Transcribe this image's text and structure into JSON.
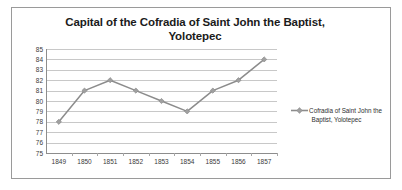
{
  "chart_data": {
    "type": "line",
    "title": "Capital of the Cofradia of Saint John the Baptist, Yolotepec",
    "title_line1": "Capital of the Cofradia of Saint John the Baptist,",
    "title_line2": "Yolotepec",
    "xlabel": "",
    "ylabel": "",
    "categories": [
      "1849",
      "1850",
      "1851",
      "1852",
      "1853",
      "1854",
      "1855",
      "1856",
      "1857"
    ],
    "values": [
      78,
      81,
      82,
      81,
      80,
      79,
      81,
      82,
      84
    ],
    "series": [
      {
        "name": "Cofradia of Saint John the Baptist, Yolotepec",
        "values": [
          78,
          81,
          82,
          81,
          80,
          79,
          81,
          82,
          84
        ]
      }
    ],
    "ylim": [
      75,
      85
    ],
    "ytick_labels": [
      "85",
      "84",
      "83",
      "82",
      "81",
      "80",
      "79",
      "78",
      "77",
      "76",
      "75"
    ],
    "ytick_step": 1,
    "grid": true,
    "grid_axis": "y",
    "legend_position": "right",
    "legend": {
      "marker": "line-with-diamond",
      "line1": "Cofradia of Saint John the",
      "line2": "Baptist, Yolotepec",
      "text": "Cofradia of Saint John the Baptist, Yolotepec"
    },
    "colors": {
      "series_line": "#8c8c8c",
      "marker": "#a0a0a0",
      "gridline": "#c8c8c8",
      "axis": "#8d8d8d",
      "text": "#3a3a3a",
      "title": "#1b1b1b",
      "border": "#9a9a9a",
      "background": "#ffffff"
    }
  }
}
